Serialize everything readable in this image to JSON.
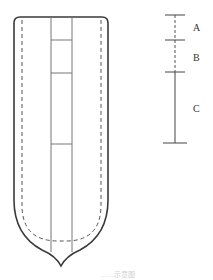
{
  "diagram": {
    "type": "schematic",
    "colors": {
      "line": "#3a3a3a",
      "thin_line": "#777777",
      "dashed": "#555555",
      "background": "#ffffff",
      "caption": "#cfcfcf"
    },
    "main_shape": {
      "description": "rounded container with pointed bottom, inner dashed outline, central vertical strip divided into sections",
      "outer": {
        "left": 14,
        "right": 108,
        "top": 17,
        "tip_x": 61,
        "tip_y": 266
      },
      "inner_dashed": {
        "left": 22,
        "right": 101,
        "top": 20,
        "bottom": 241
      },
      "central_strip": {
        "left": 51,
        "right": 72,
        "dividers_y": [
          40,
          73,
          144
        ]
      }
    },
    "scale_bar": {
      "x": 175,
      "ticks_y": [
        15,
        40,
        72,
        143
      ],
      "segments": [
        {
          "label": "A",
          "from_y": 15,
          "to_y": 40,
          "style": "dashed"
        },
        {
          "label": "B",
          "from_y": 40,
          "to_y": 72,
          "style": "dashed"
        },
        {
          "label": "C",
          "from_y": 72,
          "to_y": 143,
          "style": "solid"
        }
      ]
    },
    "caption": "……示意图"
  }
}
